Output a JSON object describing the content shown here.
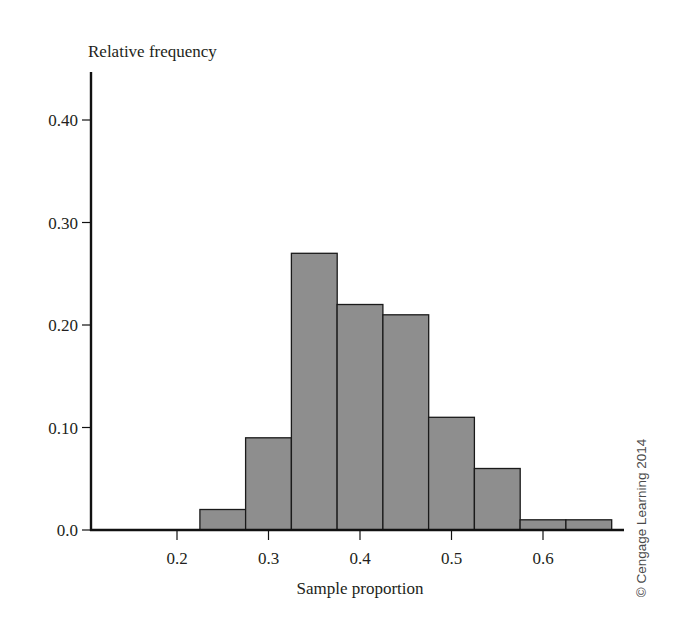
{
  "chart_data": {
    "type": "bar",
    "subtype": "histogram",
    "title": "",
    "xlabel": "Sample proportion",
    "ylabel": "Relative frequency",
    "bin_width": 0.05,
    "bins": [
      {
        "from": 0.225,
        "to": 0.275,
        "value": 0.02
      },
      {
        "from": 0.275,
        "to": 0.325,
        "value": 0.09
      },
      {
        "from": 0.325,
        "to": 0.375,
        "value": 0.27
      },
      {
        "from": 0.375,
        "to": 0.425,
        "value": 0.22
      },
      {
        "from": 0.425,
        "to": 0.475,
        "value": 0.21
      },
      {
        "from": 0.475,
        "to": 0.525,
        "value": 0.11
      },
      {
        "from": 0.525,
        "to": 0.575,
        "value": 0.06
      },
      {
        "from": 0.575,
        "to": 0.625,
        "value": 0.01
      },
      {
        "from": 0.625,
        "to": 0.675,
        "value": 0.01
      }
    ],
    "categories": [
      "0.25",
      "0.30",
      "0.35",
      "0.40",
      "0.45",
      "0.50",
      "0.55",
      "0.60",
      "0.65"
    ],
    "values": [
      0.02,
      0.09,
      0.27,
      0.22,
      0.21,
      0.11,
      0.06,
      0.01,
      0.01
    ],
    "x_ticks": [
      "0.2",
      "0.3",
      "0.4",
      "0.5",
      "0.6"
    ],
    "x_tick_values": [
      0.2,
      0.3,
      0.4,
      0.5,
      0.6
    ],
    "y_ticks": [
      "0.0",
      "0.10",
      "0.20",
      "0.30",
      "0.40"
    ],
    "y_tick_values": [
      0.0,
      0.1,
      0.2,
      0.3,
      0.4
    ],
    "xlim": [
      0.11,
      0.7
    ],
    "ylim": [
      0.0,
      0.45
    ],
    "grid": false,
    "legend": null,
    "bar_color": "#8e8e8e",
    "edge_color": "#1a1a1a",
    "annotations": [
      "© Cengage Learning 2014"
    ]
  },
  "labels": {
    "ylabel": "Relative frequency",
    "xlabel": "Sample proportion",
    "copyright": "© Cengage Learning 2014"
  }
}
